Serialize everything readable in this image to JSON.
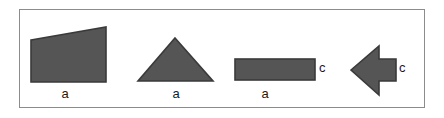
{
  "figure": {
    "background_color": "#ffffff",
    "frame_border_color": "#8c8c8c",
    "shape_fill_color": "#555555",
    "shape_stroke_color": "#3a3a3a",
    "label_color": "#1a1a1a"
  },
  "shapes": [
    {
      "id": "trapezoid",
      "name": "trapezoid",
      "label": "a",
      "label_position": "below"
    },
    {
      "id": "triangle",
      "name": "triangle",
      "label": "a",
      "label_position": "below"
    },
    {
      "id": "rectangle",
      "name": "rectangle",
      "label": "a",
      "side_label": "c",
      "label_position": "below",
      "side_label_position": "right"
    },
    {
      "id": "arrow",
      "name": "left-pointing-arrow",
      "side_label": "c",
      "side_label_position": "right"
    }
  ],
  "labels": {
    "trapezoid_bottom": "a",
    "triangle_bottom": "a",
    "rectangle_bottom": "a",
    "rectangle_right": "c",
    "arrow_right": "c"
  }
}
